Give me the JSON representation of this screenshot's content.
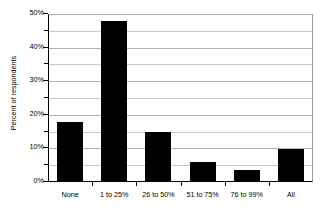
{
  "chart_data": {
    "type": "bar",
    "title": "",
    "subtitle": "",
    "xlabel": "",
    "ylabel": "Percent of respondents",
    "categories": [
      "None",
      "1 to 25%",
      "26 to 50%",
      "51 to 75%",
      "76 to 99%",
      "All"
    ],
    "values": [
      18,
      48,
      15,
      6,
      3.5,
      9.7
    ],
    "value_labels": [
      "18%",
      "48%",
      "15%",
      "6%",
      "3.5%",
      "9.7%"
    ],
    "ylim": [
      0,
      50
    ],
    "ytick_values": [
      0,
      5,
      10,
      15,
      20,
      25,
      30,
      35,
      40,
      45,
      50
    ],
    "ytick_labels": [
      "0%",
      "",
      "10%",
      "",
      "20%",
      "",
      "30%",
      "",
      "40%",
      "",
      "50%"
    ],
    "ytick_major": [
      0,
      10,
      20,
      30,
      40,
      50
    ],
    "grid": true,
    "grid_axis": "y",
    "legend": false,
    "legend_position": "none",
    "bar_color": "#000000",
    "gridline_color": "#c8c8c8",
    "axis_color": "#000000",
    "plot_background": "#ffffff",
    "annotations": []
  }
}
